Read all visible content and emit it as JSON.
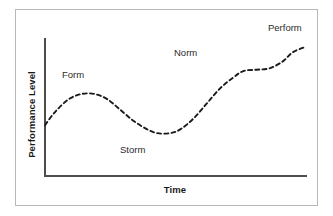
{
  "figure": {
    "frame_color": "#b8b8b8",
    "background": "#ffffff",
    "axis_color": "#4d4d4d",
    "curve_color": "#1a1a1a"
  },
  "axes": {
    "ylabel": "Performance Level",
    "xlabel": "Time"
  },
  "labels": {
    "form": "Form",
    "storm": "Storm",
    "norm": "Norm",
    "perform": "Perform"
  },
  "chart_data": {
    "type": "line",
    "title": "",
    "subtitle": "",
    "xlabel": "Time",
    "ylabel": "Performance Level",
    "grid": false,
    "legend": null,
    "axis_ticks": {
      "x": [],
      "y": []
    },
    "xlim": [
      0,
      100
    ],
    "ylim": [
      0,
      100
    ],
    "line_style": "dashed",
    "series": [
      {
        "name": "Team Performance",
        "x": [
          0,
          4,
          9,
          14,
          19,
          24,
          29,
          34,
          39,
          43,
          48,
          52,
          57,
          62,
          67,
          72,
          76,
          81,
          86,
          91,
          95,
          100
        ],
        "values": [
          37,
          47,
          56,
          60,
          60,
          56,
          48,
          40,
          34,
          31,
          31,
          34,
          42,
          53,
          64,
          72,
          77,
          78,
          79,
          84,
          91,
          95
        ]
      }
    ],
    "annotations": [
      {
        "text": "Form",
        "x": 15,
        "y": 75,
        "stage": 1
      },
      {
        "text": "Storm",
        "x": 41,
        "y": 17,
        "stage": 2
      },
      {
        "text": "Norm",
        "x": 63,
        "y": 90,
        "stage": 3
      },
      {
        "text": "Perform",
        "x": 94,
        "y": 107,
        "stage": 4
      }
    ]
  }
}
